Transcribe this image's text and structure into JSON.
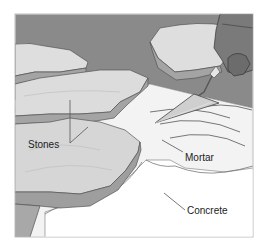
{
  "figure": {
    "labels": {
      "stones": "Stones",
      "mortar": "Mortar",
      "concrete": "Concrete"
    },
    "colors": {
      "background_wall": "#8a8a8a",
      "stone_top": "#dcdcdc",
      "stone_edge": "#a4a4a4",
      "mortar": "#f2f2f2",
      "concrete": "#ffffff",
      "frame_border": "#bdbdbd",
      "glove": "#7a7a7a",
      "trowel_blade": "#cfcfcf",
      "label_text": "#222222"
    }
  }
}
